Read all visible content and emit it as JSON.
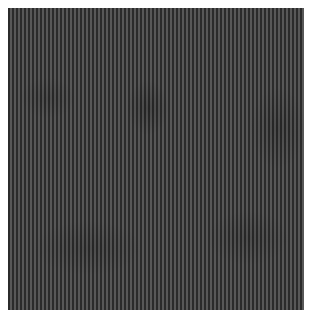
{
  "image": {
    "description": "Close-up texture of dark gray fabric with fine vertical ribbed stripes",
    "colors": {
      "background": "#ffffff",
      "stripe_dark": "#2b2b2b",
      "stripe_light": "#585858",
      "base": "#3a3a3a"
    },
    "stripe_orientation": "vertical",
    "stripe_period_px": 4
  }
}
